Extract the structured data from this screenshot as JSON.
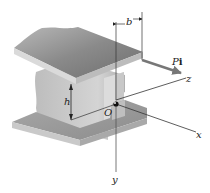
{
  "diagram": {
    "labels": {
      "b": "b",
      "h": "h",
      "O": "O",
      "x": "x",
      "y": "y",
      "z": "z",
      "force_P": "P",
      "force_i": "i"
    },
    "colors": {
      "flange_top": "#8a8a8a",
      "flange_edge": "#d9d9d9",
      "web": "#c4c4c4",
      "axis_line": "#333333",
      "force_arrow": "#777777"
    }
  }
}
